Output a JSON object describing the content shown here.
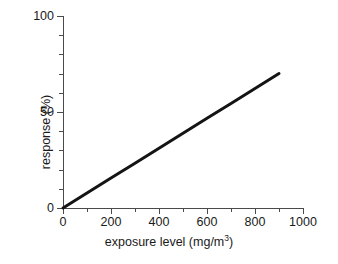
{
  "chart_data": {
    "type": "line",
    "title": "",
    "xlabel": "exposure level (mg/m",
    "xlabel_sup": "3",
    "xlabel_tail": ")",
    "xlabel_full": "exposure level (mg/m3)",
    "ylabel": "response (%)",
    "xlim": [
      0,
      1000
    ],
    "ylim": [
      0,
      100
    ],
    "grid": false,
    "legend": "none",
    "x_ticks": [
      0,
      200,
      400,
      600,
      800,
      1000
    ],
    "x_tick_labels": [
      "0",
      "200",
      "400",
      "600",
      "800",
      "1000"
    ],
    "x_minor_ticks": [
      100,
      300,
      500,
      700,
      900
    ],
    "y_ticks": [
      0,
      50,
      100
    ],
    "y_tick_labels": [
      "0",
      "50",
      "100"
    ],
    "y_minor_ticks": [
      10,
      20,
      30,
      40,
      60,
      70,
      80,
      90
    ],
    "series": [
      {
        "name": "dose-response",
        "color": "#141414",
        "line_width": 3,
        "x": [
          0,
          900
        ],
        "values": [
          0,
          70
        ],
        "points": [
          {
            "x": 0,
            "y": 0
          },
          {
            "x": 100,
            "y": 7.8
          },
          {
            "x": 200,
            "y": 15.6
          },
          {
            "x": 300,
            "y": 23.3
          },
          {
            "x": 400,
            "y": 31.1
          },
          {
            "x": 500,
            "y": 38.9
          },
          {
            "x": 600,
            "y": 46.7
          },
          {
            "x": 700,
            "y": 54.4
          },
          {
            "x": 800,
            "y": 62.2
          },
          {
            "x": 900,
            "y": 70
          }
        ]
      }
    ]
  },
  "axis": {
    "color": "#4a4a4a",
    "text_color": "#1a1a1a"
  },
  "background": "#ffffff"
}
